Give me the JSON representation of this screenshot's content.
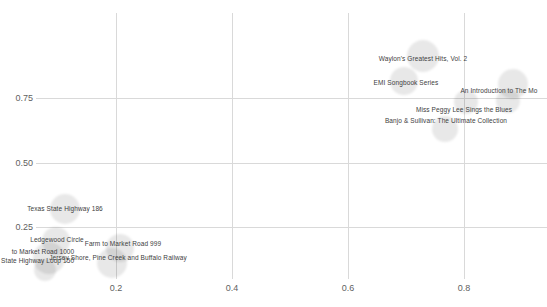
{
  "chart_data": {
    "type": "scatter",
    "title": "",
    "xlabel": "",
    "ylabel": "",
    "x_tick_labels": [
      "0.2",
      "0.4",
      "0.6",
      "0.8"
    ],
    "y_tick_labels": [
      "0.75",
      "0.50",
      "0.25"
    ],
    "xlim": [
      0.0,
      0.94
    ],
    "ylim": [
      0.03,
      1.08
    ],
    "grid": true,
    "legend": false,
    "points": [
      {
        "label": "Waylon's Greatest Hits, Vol. 2",
        "x": 0.73,
        "y": 0.91,
        "size": 16,
        "px": 423,
        "py": 56,
        "r": 16,
        "lx": 423,
        "ly": 59
      },
      {
        "label": "EMI Songbook Series",
        "x": 0.7,
        "y": 0.82,
        "size": 14,
        "px": 404,
        "py": 81,
        "r": 14,
        "lx": 406,
        "ly": 83
      },
      {
        "label": "An Introduction to The Mo",
        "x": 0.88,
        "y": 0.8,
        "size": 15,
        "px": 513,
        "py": 84,
        "r": 15,
        "lx": 499,
        "ly": 91
      },
      {
        "label": "Miss Peggy Lee Sings the Blues",
        "x": 0.8,
        "y": 0.73,
        "size": 12,
        "px": 466,
        "py": 102,
        "r": 12,
        "lx": 464,
        "ly": 110
      },
      {
        "label": "",
        "x": 0.88,
        "y": 0.74,
        "size": 12,
        "px": 508,
        "py": 101,
        "r": 12,
        "lx": 508,
        "ly": 101
      },
      {
        "label": "Banjo & Sullivan: The Ultimate Collection",
        "x": 0.77,
        "y": 0.63,
        "size": 13,
        "px": 445,
        "py": 129,
        "r": 13,
        "lx": 446,
        "ly": 121
      },
      {
        "label": "Texas State Highway 186",
        "x": 0.11,
        "y": 0.32,
        "size": 15,
        "px": 65,
        "py": 209,
        "r": 15,
        "lx": 65,
        "ly": 209
      },
      {
        "label": "Ledgewood Circle",
        "x": 0.1,
        "y": 0.2,
        "size": 14,
        "px": 56,
        "py": 241,
        "r": 14,
        "lx": 57,
        "ly": 240
      },
      {
        "label": "Farm to Market Road 999",
        "x": 0.21,
        "y": 0.17,
        "size": 14,
        "px": 120,
        "py": 248,
        "r": 14,
        "lx": 123,
        "ly": 244
      },
      {
        "label": "to Market Road 1000",
        "x": 0.08,
        "y": 0.13,
        "size": 16,
        "px": 49,
        "py": 258,
        "r": 16,
        "lx": 43,
        "ly": 252
      },
      {
        "label": "Jersey Shore, Pine Creek and Buffalo Railway",
        "x": 0.19,
        "y": 0.11,
        "size": 15,
        "px": 112,
        "py": 263,
        "r": 15,
        "lx": 118,
        "ly": 258
      },
      {
        "label": "s State Highway Loop 150",
        "x": 0.08,
        "y": 0.08,
        "size": 11,
        "px": 45,
        "py": 270,
        "r": 11,
        "lx": 35,
        "ly": 261
      }
    ]
  },
  "layout": {
    "width": 547,
    "height": 307,
    "colors": {
      "background": "#ffffff",
      "grid": "#d9d9d9",
      "bubble": "rgba(0,0,0,0.09)",
      "point_label": "#404040",
      "tick_label": "#5f5f5f"
    },
    "x_ticks": [
      {
        "label": "0.2",
        "px": 116
      },
      {
        "label": "0.4",
        "px": 232
      },
      {
        "label": "0.6",
        "px": 348
      },
      {
        "label": "0.8",
        "px": 464
      }
    ],
    "y_ticks": [
      {
        "label": "0.75",
        "py": 98
      },
      {
        "label": "0.50",
        "py": 163
      },
      {
        "label": "0.25",
        "py": 227
      }
    ],
    "plot": {
      "grid_top": 13,
      "grid_bottom": 279,
      "grid_left": 36,
      "grid_right": 547,
      "x_tick_y": 283,
      "y_tick_right_edge": 33
    }
  }
}
